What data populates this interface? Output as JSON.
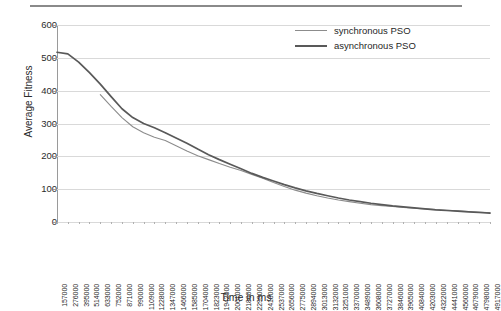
{
  "chart_data": {
    "type": "line",
    "title": "",
    "xlabel": "Time in ms",
    "ylabel": "Average Fitness",
    "ylim": [
      0,
      600
    ],
    "yticks": [
      0,
      100,
      200,
      300,
      400,
      500,
      600
    ],
    "grid": true,
    "legend_position": "top-right",
    "x": [
      157000,
      276000,
      395000,
      514000,
      633000,
      752000,
      871000,
      990000,
      1109000,
      1228000,
      1347000,
      1466000,
      1585000,
      1704000,
      1823000,
      1942000,
      2061000,
      2180000,
      2299000,
      2418000,
      2537000,
      2656000,
      2775000,
      2894000,
      3013000,
      3132000,
      3251000,
      3370000,
      3489000,
      3608000,
      3727000,
      3846000,
      3965000,
      4084000,
      4203000,
      4322000,
      4441000,
      4560000,
      4679000,
      4798000,
      4917000
    ],
    "series": [
      {
        "name": "synchronous PSO",
        "color": "#8c8c8c",
        "values": [
          null,
          null,
          null,
          null,
          388,
          352,
          318,
          290,
          272,
          258,
          248,
          232,
          216,
          202,
          190,
          178,
          167,
          157,
          145,
          133,
          120,
          108,
          97,
          88,
          80,
          73,
          67,
          62,
          57,
          53,
          50,
          47,
          44,
          42,
          40,
          38,
          36,
          34,
          32,
          30,
          28
        ]
      },
      {
        "name": "asynchronous PSO",
        "color": "#595959",
        "values": [
          517,
          512,
          487,
          455,
          420,
          382,
          345,
          318,
          300,
          287,
          272,
          256,
          240,
          222,
          205,
          190,
          176,
          162,
          148,
          136,
          125,
          114,
          104,
          95,
          87,
          80,
          73,
          67,
          62,
          57,
          53,
          49,
          46,
          43,
          40,
          37,
          35,
          33,
          31,
          29,
          27
        ]
      }
    ]
  },
  "legend": {
    "items": [
      {
        "label": "synchronous PSO",
        "color": "#8c8c8c",
        "width": 1.6
      },
      {
        "label": "asynchronous PSO",
        "color": "#595959",
        "width": 2.6
      }
    ]
  },
  "axes": {
    "y_title": "Average Fitness",
    "x_title": "Time in ms",
    "y_tick_labels": [
      "600",
      "500",
      "400",
      "300",
      "200",
      "100",
      "0"
    ],
    "x_tick_labels": [
      "157000",
      "276000",
      "395000",
      "514000",
      "633000",
      "752000",
      "871000",
      "990000",
      "1109000",
      "1228000",
      "1347000",
      "1466000",
      "1585000",
      "1704000",
      "1823000",
      "1942000",
      "2061000",
      "2180000",
      "2299000",
      "2418000",
      "2537000",
      "2656000",
      "2775000",
      "2894000",
      "3013000",
      "3132000",
      "3251000",
      "3370000",
      "3489000",
      "3608000",
      "3727000",
      "3846000",
      "3965000",
      "4084000",
      "4203000",
      "4322000",
      "4441000",
      "4560000",
      "4679000",
      "4798000",
      "4917000"
    ]
  },
  "colors": {
    "grid": "#d9d9d9",
    "axis": "#9a9a9a",
    "rule": "#8a8a8a",
    "text": "#2b2b2b"
  }
}
